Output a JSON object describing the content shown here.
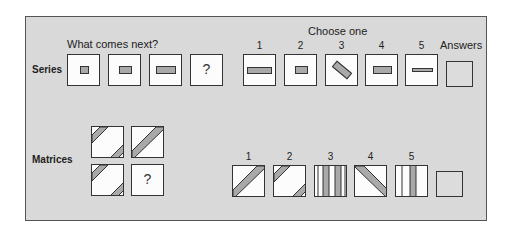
{
  "series": {
    "row_label": "Series",
    "prompt": "What comes next?",
    "question_mark": "?"
  },
  "choose": {
    "title": "Choose one",
    "numbers": [
      "1",
      "2",
      "3",
      "4",
      "5"
    ],
    "answers_label": "Answers"
  },
  "matrices": {
    "row_label": "Matrices",
    "question_mark": "?",
    "numbers": [
      "1",
      "2",
      "3",
      "4",
      "5"
    ]
  },
  "colors": {
    "panel": "#d9d9d9",
    "box": "#fcfcfc",
    "stripe": "#a9a9a9",
    "border": "#333333"
  }
}
